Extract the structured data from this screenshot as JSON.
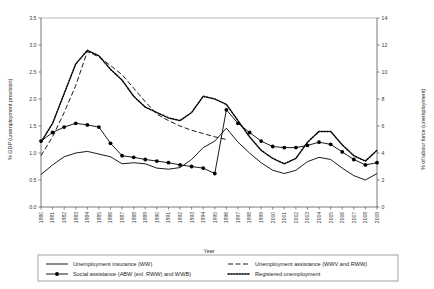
{
  "chart_data": {
    "type": "line",
    "title": "",
    "xlabel": "Year",
    "ylabel": "% GDP (unemployment provision)",
    "y2label": "% of labour force (unemployment)",
    "xlim": [
      1980,
      2009
    ],
    "ylim": [
      0.0,
      3.5
    ],
    "y2lim": [
      0,
      14
    ],
    "grid": false,
    "legend_position": "bottom",
    "x": [
      1980,
      1981,
      1982,
      1983,
      1984,
      1985,
      1986,
      1987,
      1988,
      1989,
      1990,
      1991,
      1992,
      1993,
      1994,
      1995,
      1996,
      1997,
      1998,
      1999,
      2000,
      2001,
      2002,
      2003,
      2004,
      2005,
      2006,
      2007,
      2008,
      2009
    ],
    "ytick_labels": [
      "0.0",
      "0.5",
      "1.0",
      "1.5",
      "2.0",
      "2.5",
      "3.0",
      "3.5"
    ],
    "ytick_values": [
      0.0,
      0.5,
      1.0,
      1.5,
      2.0,
      2.5,
      3.0,
      3.5
    ],
    "y2tick_labels": [
      "0",
      "2",
      "4",
      "6",
      "8",
      "10",
      "12",
      "14"
    ],
    "y2tick_values": [
      0,
      2,
      4,
      6,
      8,
      10,
      12,
      14
    ],
    "xtick_labels": [
      "1980",
      "1981",
      "1982",
      "1983",
      "1984",
      "1985",
      "1986",
      "1987",
      "1988",
      "1989",
      "1990",
      "1991",
      "1992",
      "1993",
      "1994",
      "1995",
      "1996",
      "1997",
      "1998",
      "1999",
      "2000",
      "2001",
      "2002",
      "2003",
      "2004",
      "2005",
      "2006",
      "2007",
      "2008",
      "2009"
    ],
    "series": [
      {
        "name": "Unemployment insurance (WW)",
        "axis": "left",
        "style": "solid",
        "marker": "none",
        "values": [
          0.6,
          0.78,
          0.93,
          1.0,
          1.03,
          0.98,
          0.93,
          0.8,
          0.82,
          0.8,
          0.72,
          0.7,
          0.73,
          0.88,
          1.1,
          1.22,
          1.46,
          1.2,
          1.0,
          0.82,
          0.68,
          0.62,
          0.68,
          0.84,
          0.92,
          0.88,
          0.72,
          0.58,
          0.5,
          0.62
        ]
      },
      {
        "name": "Unemployment assistance (WWV and RWW)",
        "axis": "left",
        "style": "dashed",
        "marker": "none",
        "values": [
          0.95,
          1.3,
          1.75,
          2.25,
          2.88,
          2.78,
          2.62,
          2.45,
          2.2,
          1.95,
          1.72,
          1.6,
          1.5,
          1.42,
          1.36,
          1.3,
          1.25,
          null,
          null,
          null,
          null,
          null,
          null,
          null,
          null,
          null,
          null,
          null,
          null,
          null
        ]
      },
      {
        "name": "Social assistance (ABW (exl. RWW) and WWB)",
        "axis": "left",
        "style": "solid",
        "marker": "circle",
        "values": [
          1.22,
          1.38,
          1.48,
          1.55,
          1.52,
          1.48,
          1.18,
          0.95,
          0.92,
          0.88,
          0.85,
          0.82,
          0.78,
          0.75,
          0.72,
          0.62,
          1.8,
          1.55,
          1.38,
          1.22,
          1.12,
          1.1,
          1.1,
          1.14,
          1.2,
          1.16,
          1.02,
          0.88,
          0.78,
          0.82
        ]
      },
      {
        "name": "Registered unemployment",
        "axis": "right",
        "style": "dotted",
        "values": [
          4.8,
          6.2,
          8.4,
          10.6,
          11.6,
          11.2,
          10.2,
          9.4,
          8.2,
          7.4,
          7.0,
          6.6,
          6.4,
          7.0,
          8.2,
          8.0,
          7.6,
          6.4,
          5.2,
          4.2,
          3.6,
          3.2,
          3.6,
          4.8,
          5.6,
          5.6,
          4.6,
          3.8,
          3.4,
          4.2
        ]
      }
    ]
  },
  "legend": {
    "entries": [
      {
        "label": "Unemployment insurance (WW)",
        "style": "solid",
        "marker": "none"
      },
      {
        "label": "Unemployment assistance (WWV and RWW)",
        "style": "dashed",
        "marker": "none"
      },
      {
        "label": "Social assistance (ABW (exl. RWW) and WWB)",
        "style": "solid",
        "marker": "circle"
      },
      {
        "label": "Registered unemployment",
        "style": "dotted",
        "marker": "none"
      }
    ]
  }
}
